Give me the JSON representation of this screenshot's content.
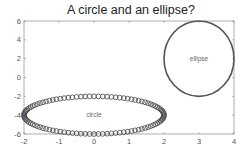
{
  "chart_data": {
    "type": "line",
    "title": "A circle and an ellipse?",
    "xlabel": "",
    "ylabel": "",
    "xlim": [
      -2,
      4
    ],
    "ylim": [
      -6,
      6
    ],
    "xticks": [
      -2,
      -1,
      0,
      1,
      2,
      3,
      4
    ],
    "yticks": [
      -6,
      -4,
      -2,
      0,
      2,
      4,
      6
    ],
    "grid": false,
    "legend": null,
    "series": [
      {
        "name": "circle",
        "shape": "parametric-ellipse",
        "center": [
          0,
          -4
        ],
        "radius_x": 2,
        "radius_y": 2,
        "style": "circle-markers",
        "marker_count": 100,
        "color": "#444444"
      },
      {
        "name": "ellipse",
        "shape": "parametric-ellipse",
        "center": [
          3,
          2
        ],
        "radius_x": 1,
        "radius_y": 4,
        "style": "solid-line",
        "color": "#555555"
      }
    ],
    "annotations": [
      {
        "text": "circle",
        "x": 0,
        "y": -4
      },
      {
        "text": "ellipse",
        "x": 3,
        "y": 2
      }
    ]
  },
  "colors": {
    "frame": "#9a9a9a",
    "marker": "#444444",
    "line": "#555555",
    "text": "#222222",
    "tick_text": "#555555"
  }
}
